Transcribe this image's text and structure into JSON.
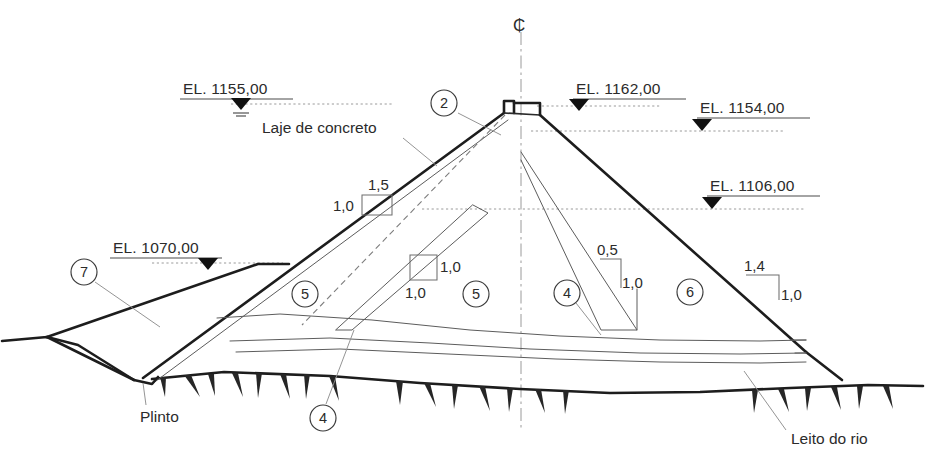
{
  "diagram": {
    "centerline_symbol": "₵",
    "colors": {
      "line_heavy": "#1d1d1d",
      "line_thin": "#5c5c5c",
      "leader": "#8e8e8e",
      "text": "#2b2b2b",
      "background": "#ffffff"
    }
  },
  "elevations": [
    {
      "id": "el-1155",
      "label": "EL. 1155,00",
      "side": "upstream"
    },
    {
      "id": "el-1070",
      "label": "EL. 1070,00",
      "side": "upstream"
    },
    {
      "id": "el-1162",
      "label": "EL. 1162,00",
      "side": "crest"
    },
    {
      "id": "el-1154",
      "label": "EL. 1154,00",
      "side": "downstream"
    },
    {
      "id": "el-1106",
      "label": "EL. 1106,00",
      "side": "downstream"
    }
  ],
  "annotations": [
    {
      "id": "laje-de-concreto",
      "label": "Laje de concreto"
    },
    {
      "id": "plinto",
      "label": "Plinto"
    },
    {
      "id": "leito-do-rio",
      "label": "Leito do rio"
    }
  ],
  "slopes": [
    {
      "id": "slope-upstream-face",
      "horizontal": "1,5",
      "vertical": "1,0"
    },
    {
      "id": "slope-inner-core",
      "horizontal": "1,0",
      "vertical": "1,0"
    },
    {
      "id": "slope-inner-drain",
      "horizontal": "0,5",
      "vertical": "1,0"
    },
    {
      "id": "slope-downstream-face",
      "horizontal": "1,4",
      "vertical": "1,0"
    }
  ],
  "zone_callouts": [
    {
      "id": "callout-2",
      "label": "2"
    },
    {
      "id": "callout-7",
      "label": "7"
    },
    {
      "id": "callout-5-left",
      "label": "5"
    },
    {
      "id": "callout-5-mid",
      "label": "5"
    },
    {
      "id": "callout-4-bottom",
      "label": "4"
    },
    {
      "id": "callout-4-mid",
      "label": "4"
    },
    {
      "id": "callout-6",
      "label": "6"
    }
  ]
}
